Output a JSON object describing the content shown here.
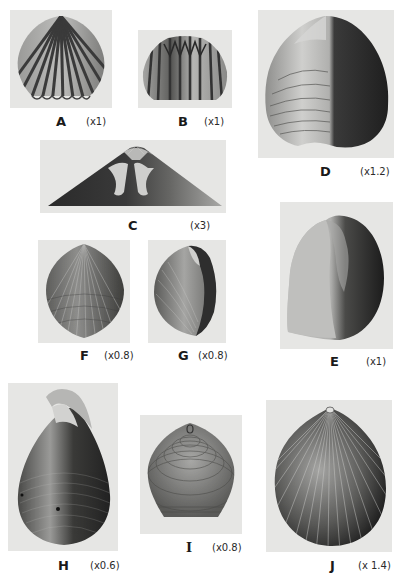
{
  "plate": {
    "figures": [
      {
        "id": "A",
        "letter": "A",
        "scale": "(x1)",
        "description": "ribbed cardiform shell, front view"
      },
      {
        "id": "B",
        "letter": "B",
        "scale": "(x1)",
        "description": "ribbed shell with zigzag commissure"
      },
      {
        "id": "C",
        "letter": "C",
        "scale": "(x3)",
        "description": "hinge region enlarged"
      },
      {
        "id": "D",
        "letter": "D",
        "scale": "(x1.2)",
        "description": "smooth cordate shell, half shaded"
      },
      {
        "id": "E",
        "letter": "E",
        "scale": "(x1)",
        "description": "smooth inflated shell, side view"
      },
      {
        "id": "F",
        "letter": "F",
        "scale": "(x0.8)",
        "description": "finely ribbed ovate shell"
      },
      {
        "id": "G",
        "letter": "G",
        "scale": "(x0.8)",
        "description": "finely ribbed shell, oblique view"
      },
      {
        "id": "H",
        "letter": "H",
        "scale": "(x0.6)",
        "description": "pyriform shell with hooked beak"
      },
      {
        "id": "I",
        "letter": "I",
        "scale": "(x0.8)",
        "description": "concentrically lined shell"
      },
      {
        "id": "J",
        "letter": "J",
        "scale": "(x 1.4)",
        "description": "radially ribbed rounded shell"
      }
    ]
  },
  "colors": {
    "background": "#ffffff",
    "panel": "#e6e6e4",
    "shell_dark": "#2b2b2b",
    "shell_mid": "#7a7a7a",
    "shell_light": "#c9c9c7"
  }
}
